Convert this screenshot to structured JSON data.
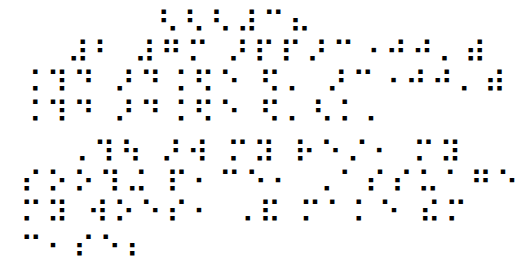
{
  "document": {
    "type": "braille-text",
    "lines": [
      {
        "text": "⠣⠣⠣⠼⠉⠦",
        "x": 157,
        "y": 8
      },
      {
        "text": "⠼⠃ ⠼⠛⠍ ⠜⠏⠏⠜⠉⠐⠚⠚⠄⠾",
        "x": 67,
        "y": 38
      },
      {
        "text": "⠨⠹⠙ ⠜⠙⠨⠫⠑ ⠫⠄ ⠜⠉⠐⠚⠚⠄⠾",
        "x": 20,
        "y": 68
      },
      {
        "text": "⠨⠹⠙ ⠜⠙⠨⠫⠑ ⠫⠄⠣⠅⠄",
        "x": 20,
        "y": 98
      },
      {
        "text": "⠠⠹⠳ ⠜⠺ ⠍⠽ ⠗⠑⠌⠂ ⠍⠽",
        "x": 67,
        "y": 138
      },
      {
        "text": "⠎⠕⠕⠹⠬ ⠏⠂⠉⠑⠂ ⠠⠁⠎⠎⠥⠁⠛⠑",
        "x": 20,
        "y": 168
      },
      {
        "text": "⠍⠽ ⠺⠕⠑⠎⠂ ⠠⠯ ⠍⠁⠅⠑ ⠮⠍",
        "x": 20,
        "y": 198
      },
      {
        "text": "⠉⠂⠎⠑⠆",
        "x": 20,
        "y": 233
      }
    ]
  }
}
